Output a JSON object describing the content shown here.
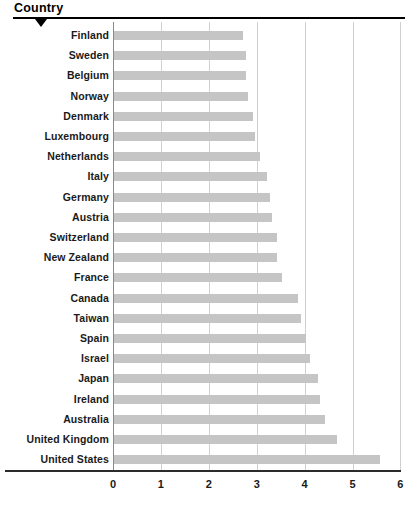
{
  "header": {
    "title": "Country",
    "marker_icon": "triangle-down-icon"
  },
  "chart_data": {
    "type": "bar",
    "orientation": "horizontal",
    "title": "",
    "subtitle": "",
    "xlabel": "",
    "ylabel": "Country",
    "xlim": [
      0,
      6
    ],
    "ylim": null,
    "grid": true,
    "legend": null,
    "legend_position": "none",
    "bar_color": "#c5c5c5",
    "xticks": [
      0,
      1,
      2,
      3,
      4,
      5,
      6
    ],
    "xtick_labels": [
      "0",
      "1",
      "2",
      "3",
      "4",
      "5",
      "6"
    ],
    "categories": [
      "Finland",
      "Sweden",
      "Belgium",
      "Norway",
      "Denmark",
      "Luxembourg",
      "Netherlands",
      "Italy",
      "Germany",
      "Austria",
      "Switzerland",
      "New Zealand",
      "France",
      "Canada",
      "Taiwan",
      "Spain",
      "Israel",
      "Japan",
      "Ireland",
      "Australia",
      "United Kingdom",
      "United States"
    ],
    "values": [
      2.7,
      2.75,
      2.75,
      2.8,
      2.9,
      2.95,
      3.05,
      3.2,
      3.25,
      3.3,
      3.4,
      3.4,
      3.5,
      3.85,
      3.9,
      4.0,
      4.1,
      4.25,
      4.3,
      4.4,
      4.65,
      5.55
    ]
  }
}
